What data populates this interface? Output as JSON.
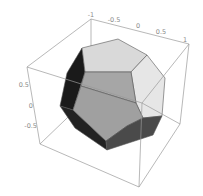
{
  "figure": {
    "type": "3d-polyhedron-plot",
    "axes": {
      "top_axis_ticks": [
        "-1",
        "-0.5",
        "0",
        "0.5",
        "1"
      ],
      "left_axis_ticks": [
        "0.5",
        "0",
        "-0.5"
      ]
    },
    "colors": {
      "background": "#ffffff",
      "box_line": "#9a9a9a",
      "edge": "#555555",
      "face_light": "#d9d9d9",
      "face_lighter": "#e6e6e6",
      "face_mid": "#a6a6a6",
      "face_dark": "#4a4a4a",
      "face_darkest": "#1a1a1a",
      "tick_text": "#8a8a8a"
    }
  }
}
